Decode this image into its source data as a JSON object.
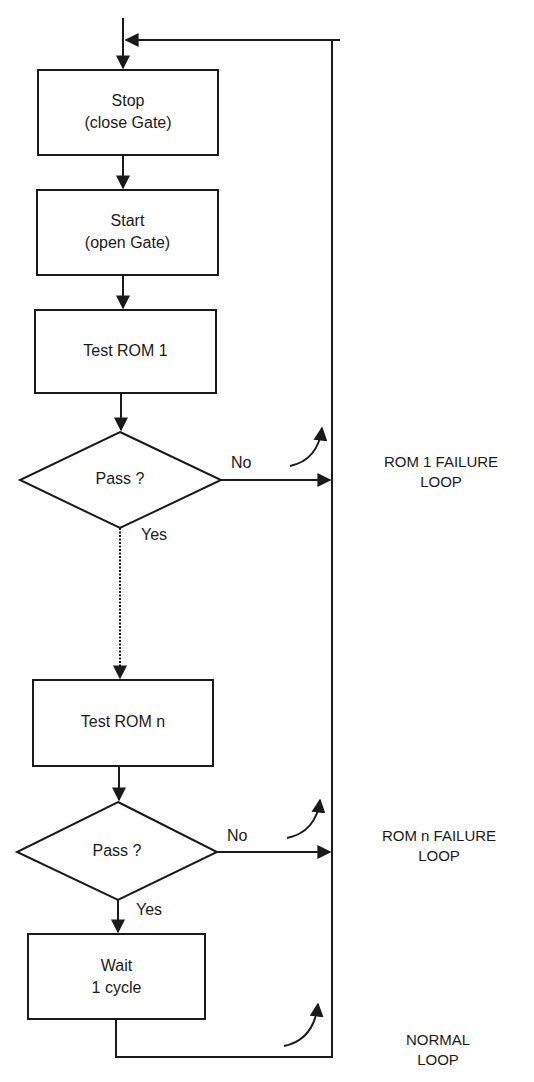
{
  "diagram": {
    "type": "flowchart",
    "nodes": [
      {
        "id": "stop",
        "shape": "rect",
        "line1": "Stop",
        "line2": "(close Gate)"
      },
      {
        "id": "start",
        "shape": "rect",
        "line1": "Start",
        "line2": "(open Gate)"
      },
      {
        "id": "test_rom_1",
        "shape": "rect",
        "line1": "Test ROM 1"
      },
      {
        "id": "pass_1",
        "shape": "diamond",
        "line1": "Pass ?"
      },
      {
        "id": "test_rom_n",
        "shape": "rect",
        "line1": "Test ROM n"
      },
      {
        "id": "pass_n",
        "shape": "diamond",
        "line1": "Pass ?"
      },
      {
        "id": "wait",
        "shape": "rect",
        "line1": "Wait",
        "line2": "1 cycle"
      }
    ],
    "edge_labels": {
      "pass_1_no": "No",
      "pass_1_yes": "Yes",
      "pass_n_no": "No",
      "pass_n_yes": "Yes"
    },
    "loops": [
      {
        "line1": "ROM 1 FAILURE",
        "line2": "LOOP"
      },
      {
        "line1": "ROM n FAILURE",
        "line2": "LOOP"
      },
      {
        "line1": "NORMAL",
        "line2": "LOOP"
      }
    ],
    "edges": [
      {
        "from": "entry",
        "to": "stop"
      },
      {
        "from": "stop",
        "to": "start"
      },
      {
        "from": "start",
        "to": "test_rom_1"
      },
      {
        "from": "test_rom_1",
        "to": "pass_1"
      },
      {
        "from": "pass_1",
        "to": "test_rom_n",
        "label": "Yes",
        "style": "dotted"
      },
      {
        "from": "pass_1",
        "to": "return_bus",
        "label": "No"
      },
      {
        "from": "test_rom_n",
        "to": "pass_n"
      },
      {
        "from": "pass_n",
        "to": "wait",
        "label": "Yes"
      },
      {
        "from": "pass_n",
        "to": "return_bus",
        "label": "No"
      },
      {
        "from": "wait",
        "to": "return_bus"
      },
      {
        "from": "return_bus",
        "to": "stop"
      }
    ],
    "colors": {
      "stroke": "#1a1a1a",
      "background": "#ffffff"
    }
  }
}
